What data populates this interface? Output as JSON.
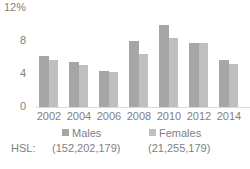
{
  "chart_data": {
    "type": "bar",
    "title": "",
    "xlabel": "",
    "ylabel": "",
    "ylim": [
      0,
      12
    ],
    "yticks": [
      "0",
      "4",
      "8",
      "12%"
    ],
    "categories": [
      "2002",
      "2004",
      "2006",
      "2008",
      "2010",
      "2012",
      "2014"
    ],
    "series": [
      {
        "name": "Males",
        "color": "#a6a6a6",
        "values": [
          6.2,
          5.5,
          4.4,
          8.0,
          9.9,
          7.8,
          5.7
        ]
      },
      {
        "name": "Females",
        "color": "#bfbfbf",
        "values": [
          5.7,
          5.1,
          4.3,
          6.4,
          8.4,
          7.8,
          5.2
        ]
      }
    ],
    "grid": false,
    "legend_position": "bottom"
  },
  "legend": {
    "hsl_label": "HSL:",
    "males_label": "Males",
    "males_hsl": "(152,202,179)",
    "females_label": "Females",
    "females_hsl": "(21,255,179)"
  }
}
